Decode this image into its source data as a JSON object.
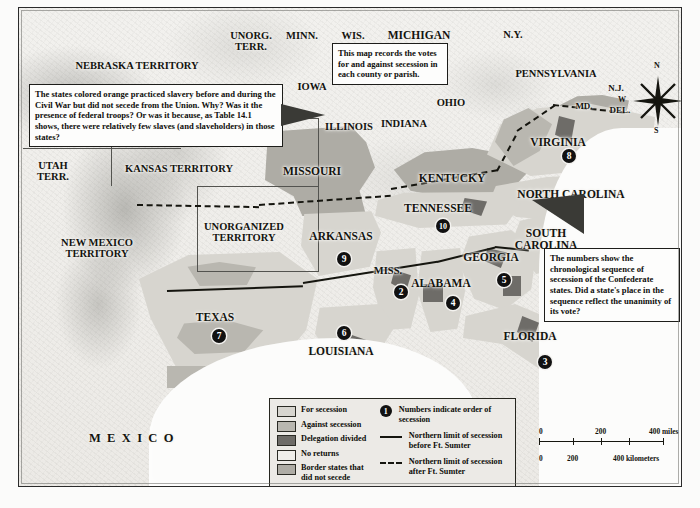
{
  "map": {
    "title": "Secession of the Confederate States",
    "mexico_label": "M E X I C O",
    "notes": [
      {
        "id": "orange-states-note",
        "text": "The states colored orange practiced slavery before and during the Civil War but did not secede from the Union. Why? Was it the presence of federal troops? Or was it because, as Table 14.1 shows, there were relatively few slaves (and slaveholders) in those states?"
      },
      {
        "id": "county-votes-note",
        "text": "This map records the votes for and against secession in each county or parish."
      },
      {
        "id": "sequence-note",
        "text": "The numbers show the chronological sequence of secession of the Confederate states. Did a state's place in the sequence reflect the unanimity of its vote?"
      }
    ],
    "territories": [
      {
        "name": "NEBRASKA TERRITORY",
        "x": 118,
        "y": 52
      },
      {
        "name": "KANSAS TERRITORY",
        "x": 160,
        "y": 155
      },
      {
        "name": "UNORGANIZED\nTERRITORY",
        "x": 225,
        "y": 213
      },
      {
        "name": "NEW MEXICO\nTERRITORY",
        "x": 78,
        "y": 229
      },
      {
        "name": "UTAH\nTERR.",
        "x": 34,
        "y": 152
      },
      {
        "name": "UNORG.\nTERR.",
        "x": 232,
        "y": 22
      }
    ],
    "states": [
      {
        "name": "MINN.",
        "x": 283,
        "y": 22,
        "size": "md"
      },
      {
        "name": "WIS.",
        "x": 334,
        "y": 22,
        "size": "md"
      },
      {
        "name": "MICHIGAN",
        "x": 400,
        "y": 21,
        "size": "lg"
      },
      {
        "name": "N.Y.",
        "x": 494,
        "y": 21,
        "size": "md"
      },
      {
        "name": "IOWA",
        "x": 293,
        "y": 73,
        "size": "md"
      },
      {
        "name": "ILLINOIS",
        "x": 330,
        "y": 113,
        "size": "md"
      },
      {
        "name": "INDIANA",
        "x": 385,
        "y": 110,
        "size": "md"
      },
      {
        "name": "OHIO",
        "x": 432,
        "y": 89,
        "size": "md"
      },
      {
        "name": "PENNSYLVANIA",
        "x": 537,
        "y": 60,
        "size": "md"
      },
      {
        "name": "N.J.",
        "x": 597,
        "y": 76,
        "size": "sm"
      },
      {
        "name": "MD.",
        "x": 565,
        "y": 94,
        "size": "sm"
      },
      {
        "name": "DEL.",
        "x": 601,
        "y": 98,
        "size": "sm"
      },
      {
        "name": "MISSOURI",
        "x": 293,
        "y": 157,
        "size": "lg"
      },
      {
        "name": "KENTUCKY",
        "x": 433,
        "y": 164,
        "size": "lg"
      },
      {
        "name": "VIRGINIA",
        "x": 539,
        "y": 128,
        "size": "lg"
      },
      {
        "name": "NORTH CAROLINA",
        "x": 552,
        "y": 180,
        "size": "lg"
      },
      {
        "name": "TENNESSEE",
        "x": 419,
        "y": 194,
        "size": "lg"
      },
      {
        "name": "ARKANSAS",
        "x": 322,
        "y": 222,
        "size": "lg"
      },
      {
        "name": "SOUTH\nCAROLINA",
        "x": 527,
        "y": 219,
        "size": "lg"
      },
      {
        "name": "GEORGIA",
        "x": 472,
        "y": 243,
        "size": "lg"
      },
      {
        "name": "MISS.",
        "x": 369,
        "y": 257,
        "size": "md"
      },
      {
        "name": "ALABAMA",
        "x": 422,
        "y": 269,
        "size": "lg"
      },
      {
        "name": "TEXAS",
        "x": 196,
        "y": 303,
        "size": "lg"
      },
      {
        "name": "LOUISIANA",
        "x": 322,
        "y": 337,
        "size": "lg"
      },
      {
        "name": "FLORIDA",
        "x": 511,
        "y": 322,
        "size": "lg"
      }
    ],
    "secession_order": [
      {
        "state": "SOUTH CAROLINA",
        "number": "1",
        "x": 528,
        "y": 253
      },
      {
        "state": "MISSISSIPPI",
        "number": "2",
        "x": 375,
        "y": 277
      },
      {
        "state": "FLORIDA",
        "number": "3",
        "x": 519,
        "y": 347
      },
      {
        "state": "ALABAMA",
        "number": "4",
        "x": 427,
        "y": 288
      },
      {
        "state": "GEORGIA",
        "number": "5",
        "x": 478,
        "y": 265
      },
      {
        "state": "LOUISIANA",
        "number": "6",
        "x": 318,
        "y": 318
      },
      {
        "state": "TEXAS",
        "number": "7",
        "x": 193,
        "y": 321
      },
      {
        "state": "VIRGINIA",
        "number": "8",
        "x": 543,
        "y": 141
      },
      {
        "state": "ARKANSAS",
        "number": "9",
        "x": 318,
        "y": 244
      },
      {
        "state": "TENNESSEE",
        "number": "10",
        "x": 417,
        "y": 211
      },
      {
        "state": "NORTH CAROLINA",
        "number": "11",
        "x": 549,
        "y": 194
      }
    ]
  },
  "legend": {
    "swatches": [
      {
        "label": "For secession",
        "color": "#d7d5cf"
      },
      {
        "label": "Against secession",
        "color": "#b9b7b0"
      },
      {
        "label": "Delegation divided",
        "color": "#6e6c68"
      },
      {
        "label": "No returns",
        "color": "#efeeea"
      },
      {
        "label": "Border states that did not secede",
        "color": "#aeaca5"
      }
    ],
    "symbols": [
      {
        "type": "number",
        "mark": "1",
        "label": "Numbers indicate order of secession"
      },
      {
        "type": "solid-line",
        "label": "Northern limit of secession before Ft. Sumter"
      },
      {
        "type": "dashed-line",
        "label": "Northern limit of secession after Ft. Sumter"
      }
    ]
  },
  "scale": {
    "miles": {
      "ticks": [
        "0",
        "200",
        "400 miles"
      ]
    },
    "kilometers": {
      "ticks": [
        "0",
        "200",
        "400 kilometers"
      ]
    }
  },
  "compass": {
    "north": "N",
    "east": "E",
    "south": "S",
    "west": "W"
  }
}
